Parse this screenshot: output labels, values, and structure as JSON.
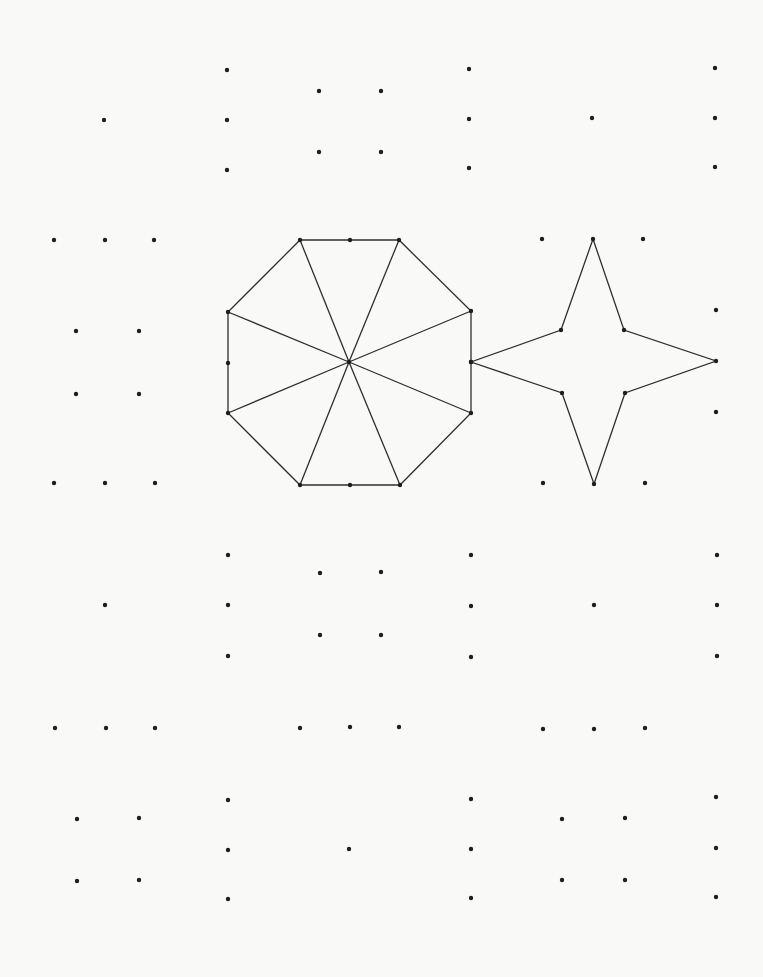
{
  "page": {
    "width": 763,
    "height": 977,
    "background": "#f9f9f8",
    "dot_color": "#1e1e1e",
    "line_color": "#2e2e2e",
    "dot_radius": 2.2
  },
  "shapes": {
    "octagon": {
      "name": "octagon-divided-into-8-triangles",
      "center": [
        349,
        362
      ],
      "vertices": [
        [
          300,
          240
        ],
        [
          399,
          240
        ],
        [
          471,
          311
        ],
        [
          471,
          413
        ],
        [
          400,
          485
        ],
        [
          300,
          485
        ],
        [
          228,
          413
        ],
        [
          228,
          312
        ]
      ],
      "side_midpoints": [
        [
          350,
          240
        ],
        [
          471,
          362
        ],
        [
          350,
          485
        ],
        [
          228,
          363
        ]
      ],
      "spokes_to": [
        [
          300,
          240
        ],
        [
          399,
          240
        ],
        [
          471,
          311
        ],
        [
          471,
          413
        ],
        [
          400,
          485
        ],
        [
          300,
          485
        ],
        [
          228,
          413
        ],
        [
          228,
          312
        ]
      ]
    },
    "star": {
      "name": "four-pointed-star",
      "vertices": [
        [
          593,
          239
        ],
        [
          624,
          330
        ],
        [
          716,
          361
        ],
        [
          625,
          393
        ],
        [
          594,
          484
        ],
        [
          562,
          393
        ],
        [
          471,
          362
        ],
        [
          561,
          330
        ]
      ]
    }
  },
  "dot_groups": [
    {
      "name": "top-left-cluster",
      "points": [
        [
          104,
          120
        ],
        [
          227,
          70
        ],
        [
          227,
          120
        ],
        [
          227,
          170
        ],
        [
          319,
          91
        ],
        [
          319,
          152
        ],
        [
          381,
          91
        ],
        [
          381,
          152
        ],
        [
          469,
          69
        ],
        [
          469,
          119
        ],
        [
          469,
          168
        ]
      ]
    },
    {
      "name": "top-right-cluster",
      "points": [
        [
          592,
          118
        ],
        [
          715,
          68
        ],
        [
          715,
          118
        ],
        [
          715,
          167
        ]
      ]
    },
    {
      "name": "row-240",
      "points": [
        [
          54,
          240
        ],
        [
          105,
          240
        ],
        [
          154,
          240
        ],
        [
          542,
          239
        ],
        [
          643,
          239
        ]
      ]
    },
    {
      "name": "left-square-upper",
      "points": [
        [
          76,
          331
        ],
        [
          139,
          331
        ],
        [
          76,
          394
        ],
        [
          139,
          394
        ]
      ]
    },
    {
      "name": "right-column-mid",
      "points": [
        [
          716,
          310
        ],
        [
          716,
          412
        ]
      ]
    },
    {
      "name": "row-483",
      "points": [
        [
          54,
          483
        ],
        [
          105,
          483
        ],
        [
          155,
          483
        ],
        [
          543,
          483
        ],
        [
          645,
          483
        ]
      ]
    },
    {
      "name": "middle-cluster",
      "points": [
        [
          105,
          605
        ],
        [
          228,
          555
        ],
        [
          228,
          605
        ],
        [
          228,
          656
        ],
        [
          320,
          573
        ],
        [
          320,
          635
        ],
        [
          381,
          572
        ],
        [
          381,
          635
        ],
        [
          471,
          555
        ],
        [
          471,
          606
        ],
        [
          471,
          657
        ],
        [
          594,
          605
        ],
        [
          717,
          555
        ],
        [
          717,
          605
        ],
        [
          717,
          656
        ]
      ]
    },
    {
      "name": "row-728",
      "points": [
        [
          55,
          728
        ],
        [
          106,
          728
        ],
        [
          155,
          728
        ],
        [
          300,
          728
        ],
        [
          350,
          727
        ],
        [
          399,
          727
        ],
        [
          543,
          729
        ],
        [
          594,
          729
        ],
        [
          645,
          728
        ]
      ]
    },
    {
      "name": "bottom-cluster",
      "points": [
        [
          77,
          819
        ],
        [
          139,
          818
        ],
        [
          77,
          881
        ],
        [
          139,
          880
        ],
        [
          228,
          800
        ],
        [
          228,
          850
        ],
        [
          228,
          899
        ],
        [
          349,
          849
        ],
        [
          471,
          799
        ],
        [
          471,
          849
        ],
        [
          471,
          898
        ],
        [
          562,
          819
        ],
        [
          625,
          818
        ],
        [
          562,
          880
        ],
        [
          625,
          880
        ],
        [
          716,
          797
        ],
        [
          716,
          848
        ],
        [
          716,
          897
        ]
      ]
    }
  ]
}
